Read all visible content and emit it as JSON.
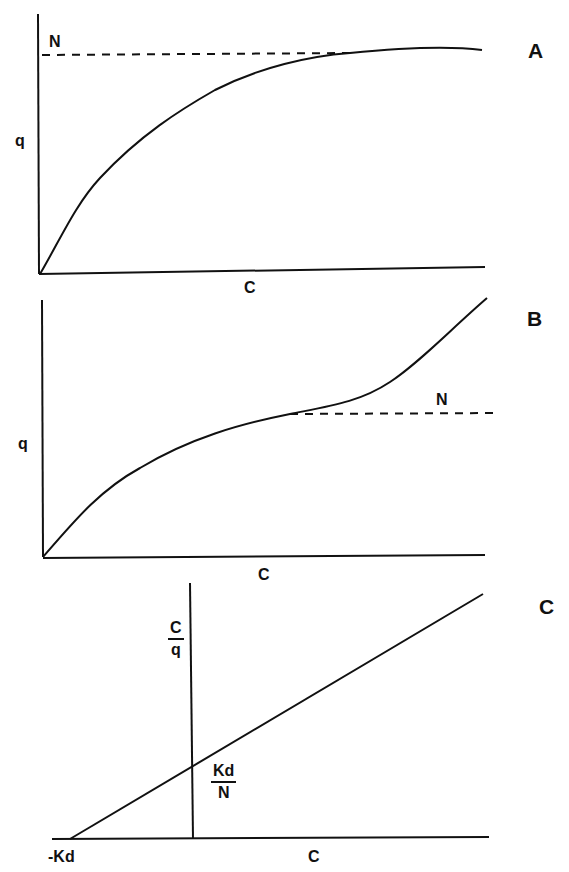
{
  "colors": {
    "ink": "#111111",
    "background": "#ffffff"
  },
  "panels": [
    {
      "id": "A",
      "label": "A",
      "y_label": "q",
      "x_label": "C",
      "asymptote_label": "N",
      "description": "Langmuir-type saturation isotherm: q rises from origin and levels off at plateau N"
    },
    {
      "id": "B",
      "label": "B",
      "y_label": "q",
      "x_label": "C",
      "asymptote_label": "N",
      "description": "Sigmoidal/multilayer isotherm: q rises toward N, then increases again beyond the plateau"
    },
    {
      "id": "C",
      "label": "C",
      "y_label_num": "C",
      "y_label_den": "q",
      "x_label": "C",
      "intercept_label_num": "Kd",
      "intercept_label_den": "N",
      "x_intercept_label": "-Kd",
      "description": "Linearized plot C/q vs C: straight line with y-intercept Kd/N and x-intercept -Kd"
    }
  ]
}
